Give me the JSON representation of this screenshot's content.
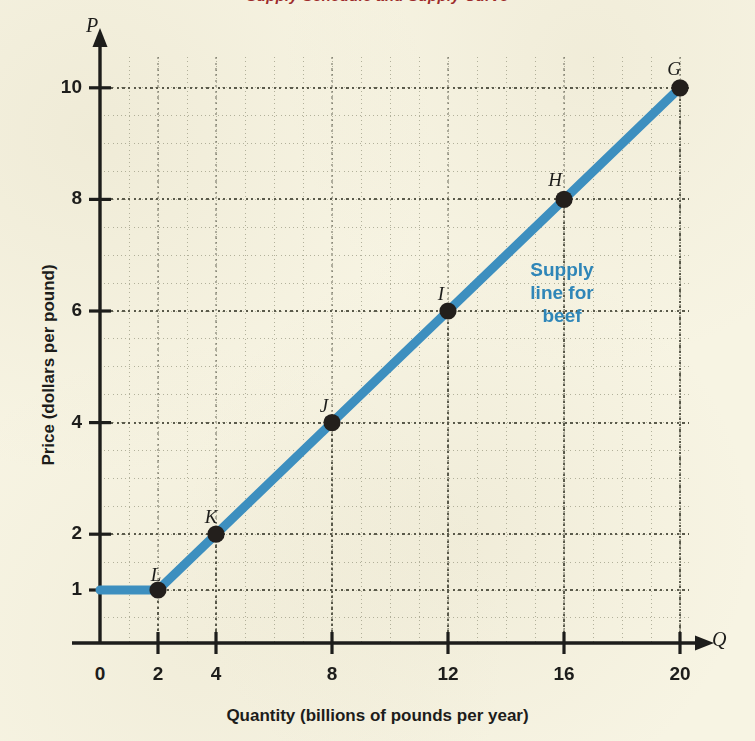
{
  "figure": {
    "cut_title": "Supply Schedule and Supply Curve",
    "background_color": "#f7f4e3",
    "line_color": "#3d8fbf",
    "point_color": "#231f1c",
    "grid_color": "#8a8a72",
    "annotation_color": "#2f86b8",
    "title_color": "#9d2b2b"
  },
  "axes": {
    "y_letter": "P",
    "x_letter": "Q",
    "y_title": "Price (dollars per pound)",
    "x_title": "Quantity (billions of pounds per year)",
    "y_ticks": [
      "1",
      "2",
      "4",
      "6",
      "8",
      "10"
    ],
    "x_ticks": [
      "0",
      "2",
      "4",
      "8",
      "12",
      "16",
      "20"
    ]
  },
  "annotation": {
    "line1": "Supply",
    "line2": "line for",
    "line3": "beef"
  },
  "chart_data": {
    "type": "line",
    "title": "Supply Schedule and Supply Curve",
    "xlabel": "Quantity (billions of pounds per year)",
    "ylabel": "Price (dollars per pound)",
    "xlim": [
      0,
      21
    ],
    "ylim": [
      0,
      10.8
    ],
    "grid": true,
    "legend": "none",
    "annotations": [
      {
        "text": "Supply line for beef",
        "x": 15.2,
        "y": 6.9,
        "color": "#2f86b8"
      }
    ],
    "series": [
      {
        "name": "Supply line for beef",
        "color": "#3d8fbf",
        "x": [
          0,
          2,
          4,
          8,
          12,
          16,
          20
        ],
        "y": [
          1,
          1,
          2,
          4,
          6,
          8,
          10
        ]
      }
    ],
    "points": [
      {
        "label": "L",
        "x": 2,
        "y": 1,
        "label_dx": -14,
        "label_dy": -26
      },
      {
        "label": "K",
        "x": 4,
        "y": 2,
        "label_dx": -17,
        "label_dy": -28
      },
      {
        "label": "J",
        "x": 8,
        "y": 4,
        "label_dx": -20,
        "label_dy": -28
      },
      {
        "label": "I",
        "x": 12,
        "y": 6,
        "label_dx": -19,
        "label_dy": -28
      },
      {
        "label": "H",
        "x": 16,
        "y": 8,
        "label_dx": -21,
        "label_dy": -30
      },
      {
        "label": "G",
        "x": 20,
        "y": 10,
        "label_dx": -18,
        "label_dy": -30
      }
    ],
    "x_tick_values": [
      0,
      2,
      4,
      8,
      12,
      16,
      20
    ],
    "y_tick_values": [
      1,
      2,
      4,
      6,
      8,
      10
    ],
    "x_minor_step": 1,
    "y_minor_step": 0.5
  }
}
